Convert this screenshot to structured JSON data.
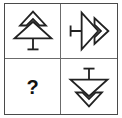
{
  "puzzle": {
    "type": "visual-analogy-matrix",
    "rows": 2,
    "columns": 2,
    "background_color": "#ffffff",
    "line_color": "#222222",
    "border_color": "#4a4a4a",
    "divider_color": "#6b6b6b",
    "cells": [
      {
        "position": "top-left",
        "content_type": "glyph",
        "icon": "double-chevron-arrow-up-with-stem-icon",
        "description": "Tree-like outline: two stacked chevrons pointing up above a vertical stem with a horizontal base bar",
        "rotation_degrees": 0,
        "label": ""
      },
      {
        "position": "top-right",
        "content_type": "glyph",
        "icon": "double-chevron-arrow-right-with-stem-icon",
        "description": "Same outline rotated 90 degrees clockwise: two chevrons pointing right with a horizontal stem and vertical end bar at left",
        "rotation_degrees": 90,
        "label": ""
      },
      {
        "position": "bottom-left",
        "content_type": "text",
        "icon": "question-mark",
        "description": "Bold question mark marking the missing answer cell",
        "rotation_degrees": 0,
        "label": "?"
      },
      {
        "position": "bottom-right",
        "content_type": "glyph",
        "icon": "double-chevron-arrow-down-with-stem-icon",
        "description": "Same outline rotated 180 degrees: two stacked chevrons pointing down below a vertical stem with a horizontal bar at top",
        "rotation_degrees": 180,
        "label": ""
      }
    ]
  }
}
